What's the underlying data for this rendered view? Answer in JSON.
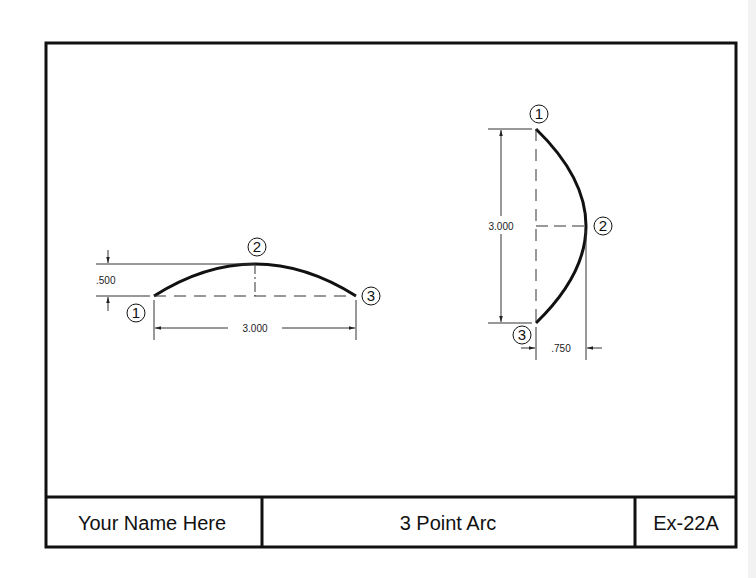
{
  "title_block": {
    "name": "Your Name Here",
    "title": "3 Point Arc",
    "sheet": "Ex-22A"
  },
  "left_arc": {
    "points": [
      "1",
      "2",
      "3"
    ],
    "height_dim": ".500",
    "chord_dim": "3.000"
  },
  "right_arc": {
    "points": [
      "1",
      "2",
      "3"
    ],
    "chord_dim": "3.000",
    "depth_dim": ".750"
  },
  "colors": {
    "line": "#111111",
    "paper": "#ffffff"
  }
}
